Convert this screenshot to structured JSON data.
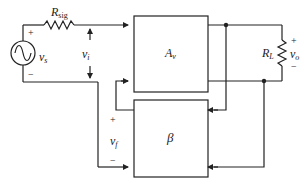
{
  "diagram": {
    "type": "feedback-amplifier-block-diagram",
    "source": {
      "label": "v",
      "sub": "s",
      "plus": "+",
      "minus": "−"
    },
    "rsig": {
      "label": "R",
      "sub": "sig"
    },
    "input_voltage": {
      "label": "v",
      "sub": "i"
    },
    "amplifier": {
      "label": "A",
      "sub": "v"
    },
    "feedback": {
      "label": "β"
    },
    "feedback_voltage": {
      "label": "v",
      "sub": "f",
      "plus": "+",
      "minus": "−"
    },
    "load": {
      "label": "R",
      "sub": "L"
    },
    "output_voltage": {
      "label": "v",
      "sub": "o",
      "plus": "+",
      "minus": "−"
    }
  }
}
